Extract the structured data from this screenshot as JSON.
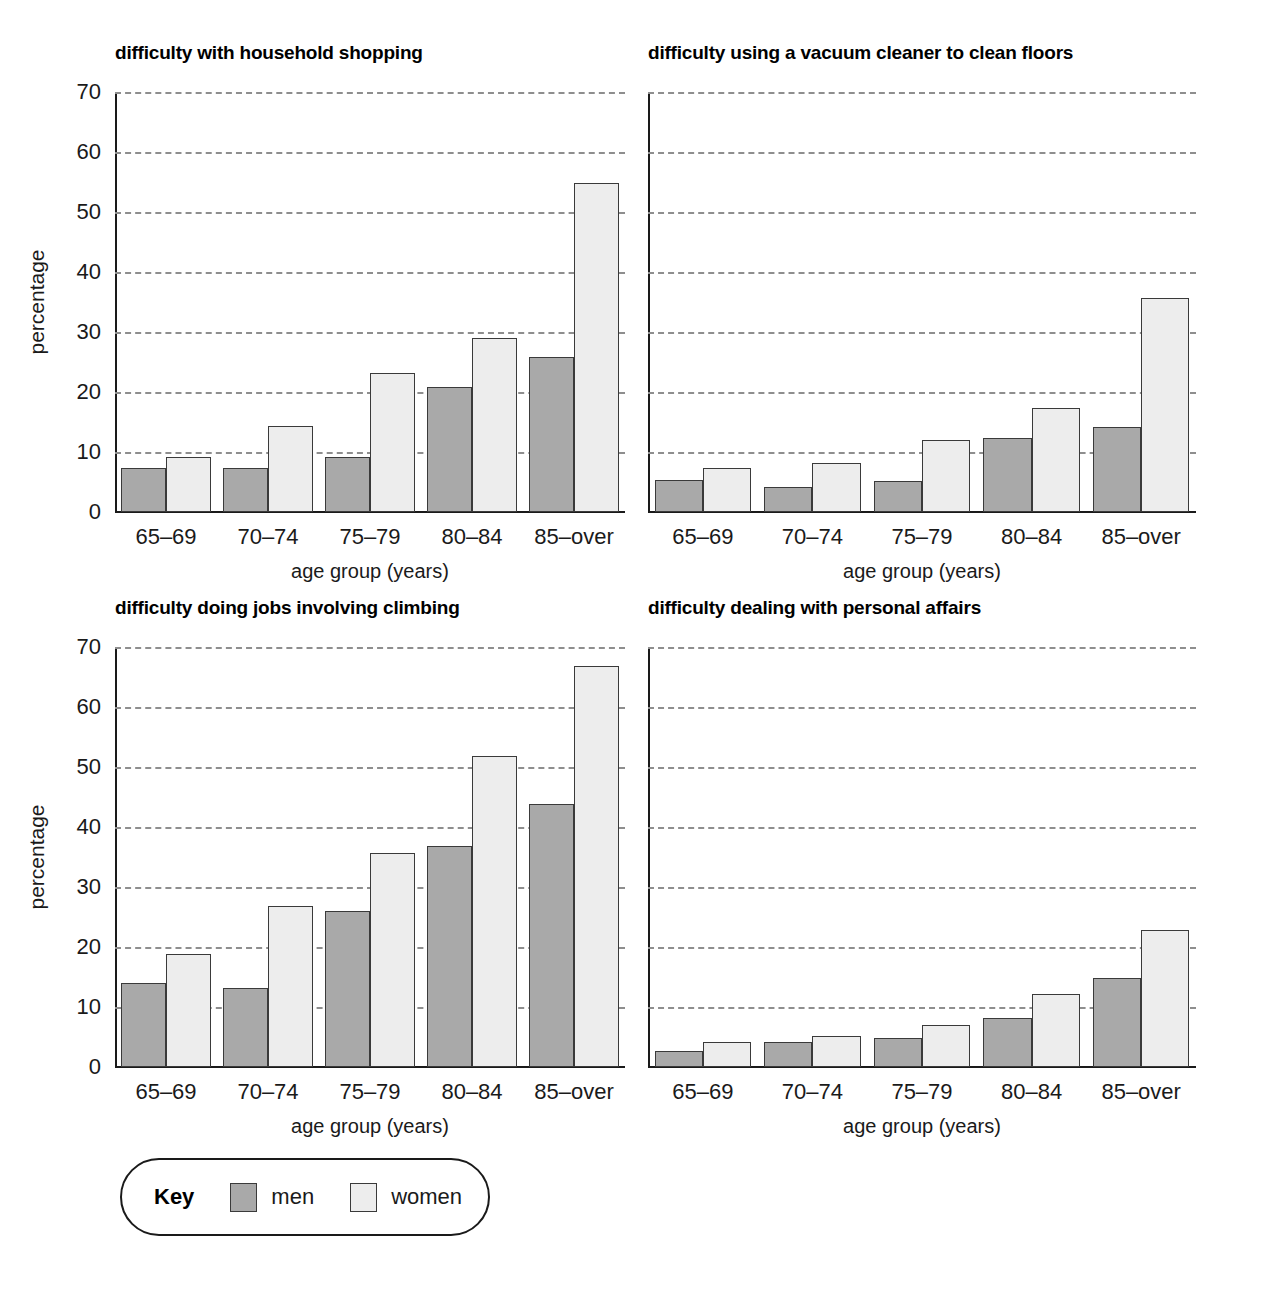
{
  "axis": {
    "ylabel": "percentage",
    "xlabel": "age group (years)",
    "yticks": [
      "70",
      "60",
      "50",
      "40",
      "30",
      "20",
      "10",
      "0"
    ],
    "ymin": 0,
    "ymax": 70,
    "ystep": 10
  },
  "categories": [
    "65–69",
    "70–74",
    "75–79",
    "80–84",
    "85–over"
  ],
  "legend": {
    "title": "Key",
    "items": [
      {
        "label": "men",
        "color": "#a9a9a9"
      },
      {
        "label": "women",
        "color": "#ededed"
      }
    ]
  },
  "panels": [
    {
      "title": "difficulty with household shopping"
    },
    {
      "title": "difficulty using a vacuum cleaner to clean floors"
    },
    {
      "title": "difficulty doing jobs involving climbing"
    },
    {
      "title": "difficulty dealing with personal affairs"
    }
  ],
  "chart_data": [
    {
      "type": "bar",
      "title": "difficulty with household shopping",
      "xlabel": "age group (years)",
      "ylabel": "percentage",
      "ylim": [
        0,
        70
      ],
      "ytick_step": 10,
      "grid": true,
      "legend_position": "bottom-left-shared",
      "categories": [
        "65–69",
        "70–74",
        "75–79",
        "80–84",
        "85–over"
      ],
      "series": [
        {
          "name": "men",
          "color": "#a9a9a9",
          "values": [
            7.3,
            7.3,
            9.2,
            20.8,
            25.9
          ]
        },
        {
          "name": "women",
          "color": "#ededed",
          "values": [
            9.2,
            14.3,
            23.1,
            29.0,
            54.9
          ]
        }
      ]
    },
    {
      "type": "bar",
      "title": "difficulty using a vacuum cleaner to clean floors",
      "xlabel": "age group (years)",
      "ylabel": "percentage",
      "ylim": [
        0,
        70
      ],
      "ytick_step": 10,
      "grid": true,
      "legend_position": "bottom-left-shared",
      "categories": [
        "65–69",
        "70–74",
        "75–79",
        "80–84",
        "85–over"
      ],
      "series": [
        {
          "name": "men",
          "color": "#a9a9a9",
          "values": [
            5.3,
            4.2,
            5.2,
            12.3,
            14.2
          ]
        },
        {
          "name": "women",
          "color": "#ededed",
          "values": [
            7.4,
            8.2,
            12.0,
            17.4,
            35.6
          ]
        }
      ]
    },
    {
      "type": "bar",
      "title": "difficulty doing jobs involving climbing",
      "xlabel": "age group (years)",
      "ylabel": "percentage",
      "ylim": [
        0,
        70
      ],
      "ytick_step": 10,
      "grid": true,
      "legend_position": "bottom-left-shared",
      "categories": [
        "65–69",
        "70–74",
        "75–79",
        "80–84",
        "85–over"
      ],
      "series": [
        {
          "name": "men",
          "color": "#a9a9a9",
          "values": [
            14.0,
            13.1,
            26.0,
            36.8,
            43.8
          ]
        },
        {
          "name": "women",
          "color": "#ededed",
          "values": [
            18.8,
            26.9,
            35.7,
            51.8,
            66.8
          ]
        }
      ]
    },
    {
      "type": "bar",
      "title": "difficulty dealing with personal affairs",
      "xlabel": "age group (years)",
      "ylabel": "percentage",
      "ylim": [
        0,
        70
      ],
      "ytick_step": 10,
      "grid": true,
      "legend_position": "bottom-left-shared",
      "categories": [
        "65–69",
        "70–74",
        "75–79",
        "80–84",
        "85–over"
      ],
      "series": [
        {
          "name": "men",
          "color": "#a9a9a9",
          "values": [
            2.7,
            4.2,
            4.8,
            8.2,
            14.8
          ]
        },
        {
          "name": "women",
          "color": "#ededed",
          "values": [
            4.1,
            5.2,
            7.0,
            12.1,
            22.8
          ]
        }
      ]
    }
  ]
}
